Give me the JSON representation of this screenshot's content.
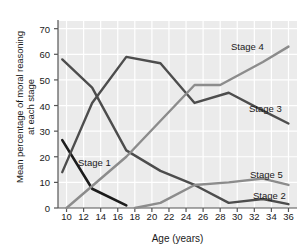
{
  "chart_data": {
    "type": "line",
    "title": "",
    "xlabel": "Age (years)",
    "ylabel": "Mean percentage of moral reasoning\nat each stage",
    "ylabel_line1": "Mean percentage of moral reasoning",
    "ylabel_line2": "at each stage",
    "xlim": [
      9,
      37
    ],
    "ylim": [
      0,
      73
    ],
    "xticks": [
      10,
      12,
      14,
      16,
      18,
      20,
      22,
      24,
      26,
      28,
      30,
      32,
      34,
      36
    ],
    "yticks": [
      0,
      10,
      20,
      30,
      40,
      50,
      60,
      70
    ],
    "grid": true,
    "legend_position": "inline-right",
    "background": "#ebebeb",
    "gridcolor": "#ffffff",
    "series": [
      {
        "name": "Stage 1",
        "label": "Stage 1",
        "color": "#1c1c1c",
        "width": 2.6,
        "label_x": 78,
        "label_y": 157,
        "points": [
          [
            9.5,
            26.5
          ],
          [
            13,
            7.5
          ],
          [
            17,
            1.0
          ]
        ]
      },
      {
        "name": "Stage 2",
        "label": "Stage 2",
        "color": "#4d4d4d",
        "width": 2.4,
        "label_x": 253,
        "label_y": 190,
        "points": [
          [
            9.5,
            58
          ],
          [
            13,
            47
          ],
          [
            17,
            22.5
          ],
          [
            21,
            14.5
          ],
          [
            25,
            9
          ],
          [
            29,
            2
          ],
          [
            33,
            3.5
          ],
          [
            36,
            1.5
          ]
        ]
      },
      {
        "name": "Stage 3",
        "label": "Stage 3",
        "color": "#4d4d4d",
        "width": 2.4,
        "label_x": 249,
        "label_y": 103,
        "points": [
          [
            9.5,
            14
          ],
          [
            13,
            41
          ],
          [
            17,
            59
          ],
          [
            21,
            56.5
          ],
          [
            25,
            41
          ],
          [
            29,
            45
          ],
          [
            33,
            38
          ],
          [
            36,
            33
          ]
        ]
      },
      {
        "name": "Stage 4",
        "label": "Stage 4",
        "color": "#8c8c8c",
        "width": 2.4,
        "label_x": 231,
        "label_y": 41,
        "points": [
          [
            10,
            0
          ],
          [
            17,
            20
          ],
          [
            25,
            48
          ],
          [
            28,
            48
          ],
          [
            33,
            57
          ],
          [
            36,
            63
          ]
        ]
      },
      {
        "name": "Stage 5",
        "label": "Stage 5",
        "color": "#8c8c8c",
        "width": 2.4,
        "label_x": 250,
        "label_y": 169,
        "points": [
          [
            18,
            0
          ],
          [
            21,
            2
          ],
          [
            25,
            9
          ],
          [
            29,
            10
          ],
          [
            33,
            11.5
          ],
          [
            36,
            9
          ]
        ]
      }
    ]
  }
}
